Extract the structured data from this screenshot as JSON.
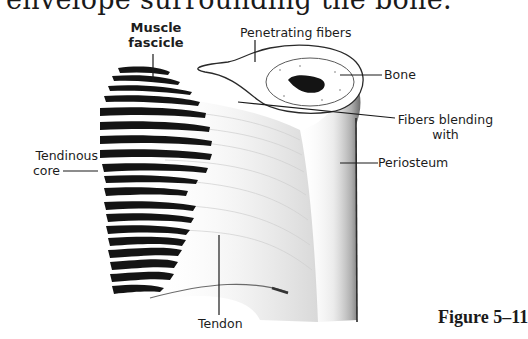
{
  "page": {
    "body_text_fragment": "envelope surrounding the bone."
  },
  "figure": {
    "caption": "Figure 5–11",
    "labels": {
      "muscle_fascicle_line1": "Muscle",
      "muscle_fascicle_line2": "fascicle",
      "penetrating_fibers": "Penetrating fibers",
      "bone": "Bone",
      "fibers_blending_line1": "Fibers blending",
      "fibers_blending_line2": "with",
      "periosteum": "Periosteum",
      "tendinous_core_line1": "Tendinous",
      "tendinous_core_line2": "core",
      "tendon": "Tendon"
    },
    "colors": {
      "ink": "#1a1a1a",
      "shading": "#8a8a8a",
      "background": "#ffffff"
    }
  }
}
